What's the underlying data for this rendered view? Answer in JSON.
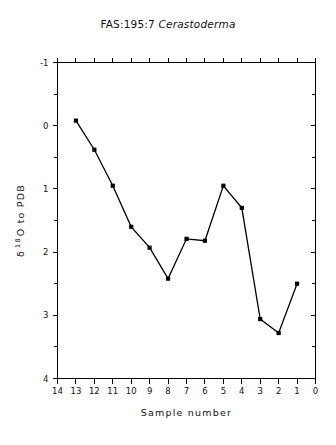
{
  "chart_data": {
    "type": "line",
    "title": "FAS:195:7 Cerastoderma",
    "title_prefix": "FAS:195:7",
    "title_species": "Cerastoderma",
    "xlabel": "Sample number",
    "ylabel": "δ 18O to PDB",
    "ylabel_delta": "δ",
    "ylabel_sup": "18",
    "ylabel_rest": "O to PDB",
    "x": [
      13,
      12,
      11,
      10,
      9,
      8,
      7,
      6,
      5,
      4,
      3,
      2,
      1
    ],
    "values": [
      -0.08,
      0.38,
      0.95,
      1.6,
      1.93,
      2.42,
      1.79,
      1.82,
      0.95,
      1.3,
      3.06,
      3.28,
      2.5
    ],
    "series": [
      {
        "name": "δ 18O to PDB",
        "values": [
          -0.08,
          0.38,
          0.95,
          1.6,
          1.93,
          2.42,
          1.79,
          1.82,
          0.95,
          1.3,
          3.06,
          3.28,
          2.5
        ]
      }
    ],
    "xlim": [
      14,
      0
    ],
    "ylim": [
      -1,
      4
    ],
    "y_inverted": true,
    "x_inverted": true,
    "xticks": [
      14,
      13,
      12,
      11,
      10,
      9,
      8,
      7,
      6,
      5,
      4,
      3,
      2,
      1,
      0
    ],
    "xtick_labels": [
      "14",
      "13",
      "12",
      "11",
      "10",
      "9",
      "8",
      "7",
      "6",
      "5",
      "4",
      "3",
      "2",
      "1",
      "0"
    ],
    "yticks": [
      -1,
      0,
      1,
      2,
      3,
      4
    ],
    "ytick_labels": [
      "-1",
      "0",
      "1",
      "2",
      "3",
      "4"
    ],
    "y_minor_ticks": [
      -0.5,
      0.5,
      1.5,
      2.5,
      3.5
    ],
    "grid": false,
    "legend": false,
    "legend_position": "none",
    "marker": "square",
    "line_color": "#000000",
    "marker_color": "#000000",
    "background_color": "#ffffff",
    "axis_color": "#000000"
  }
}
